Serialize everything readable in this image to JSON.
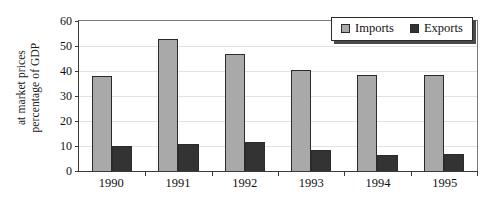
{
  "chart_data": {
    "type": "bar",
    "title": "",
    "xlabel": "",
    "ylabel": "percentage of GDP at market prices",
    "ylabel_lines": [
      "percentage of GDP",
      "at market prices"
    ],
    "categories": [
      "1990",
      "1991",
      "1992",
      "1993",
      "1994",
      "1995"
    ],
    "series": [
      {
        "name": "Imports",
        "color": "#a9a9a9",
        "values": [
          38,
          53,
          47,
          40.5,
          38.5,
          38.5
        ]
      },
      {
        "name": "Exports",
        "color": "#333333",
        "values": [
          10,
          11,
          11.5,
          8.5,
          6.5,
          7
        ]
      }
    ],
    "ylim": [
      0,
      60
    ],
    "ytick_values": [
      0,
      10,
      20,
      30,
      40,
      50,
      60
    ],
    "ytick_labels": [
      "0",
      "10",
      "20",
      "30",
      "40",
      "50",
      "60"
    ],
    "grid": true,
    "grid_axis": "y",
    "legend_position": "top-right",
    "legend_entries": [
      "Imports",
      "Exports"
    ]
  }
}
